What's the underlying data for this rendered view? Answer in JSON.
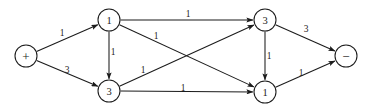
{
  "figure": {
    "title": "",
    "background_color": "#ffffff",
    "stroke_color": "#1b1b1b",
    "width": 369,
    "height": 110
  },
  "chart_data": {
    "type": "diagram",
    "subtype": "directed-flow-network",
    "title": "",
    "grid": false,
    "legend": null,
    "nodes": [
      {
        "id": "source",
        "label": "+",
        "x": 26,
        "y": 56,
        "r": 11,
        "kind": "terminal"
      },
      {
        "id": "n1",
        "label": "1",
        "x": 109,
        "y": 20,
        "r": 11,
        "kind": "internal"
      },
      {
        "id": "n2",
        "label": "3",
        "x": 109,
        "y": 91,
        "r": 11,
        "kind": "internal"
      },
      {
        "id": "n3",
        "label": "3",
        "x": 265,
        "y": 20,
        "r": 11,
        "kind": "internal"
      },
      {
        "id": "n4",
        "label": "1",
        "x": 265,
        "y": 92,
        "r": 11,
        "kind": "internal"
      },
      {
        "id": "sink",
        "label": "−",
        "x": 346,
        "y": 56,
        "r": 11,
        "kind": "terminal"
      }
    ],
    "edges": [
      {
        "id": "e1",
        "from": "source",
        "to": "n1",
        "label": "1",
        "lx": 62,
        "ly": 33
      },
      {
        "id": "e2",
        "from": "source",
        "to": "n2",
        "label": "3",
        "lx": 67,
        "ly": 70
      },
      {
        "id": "e3",
        "from": "n1",
        "to": "n2",
        "label": "1",
        "lx": 113,
        "ly": 52
      },
      {
        "id": "e4",
        "from": "n1",
        "to": "n3",
        "label": "1",
        "lx": 188,
        "ly": 14
      },
      {
        "id": "e5",
        "from": "n1",
        "to": "n4",
        "label": "1",
        "lx": 156,
        "ly": 36
      },
      {
        "id": "e6",
        "from": "n2",
        "to": "n3",
        "label": "1",
        "lx": 143,
        "ly": 70
      },
      {
        "id": "e7",
        "from": "n2",
        "to": "n4",
        "label": "1",
        "lx": 183,
        "ly": 88
      },
      {
        "id": "e8",
        "from": "n3",
        "to": "n4",
        "label": "1",
        "lx": 269,
        "ly": 56
      },
      {
        "id": "e9",
        "from": "n3",
        "to": "sink",
        "label": "3",
        "lx": 306,
        "ly": 29
      },
      {
        "id": "e10",
        "from": "n4",
        "to": "sink",
        "label": "1",
        "lx": 301,
        "ly": 73
      }
    ]
  }
}
